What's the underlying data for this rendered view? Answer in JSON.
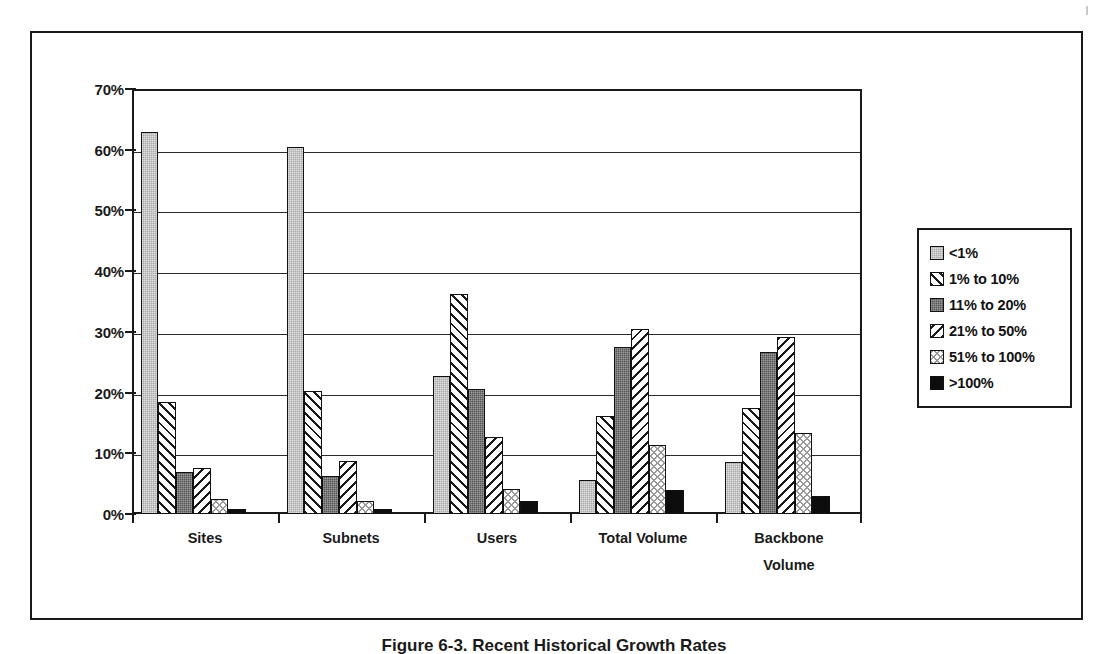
{
  "chart_data": {
    "type": "bar",
    "title": "",
    "subtitle": "",
    "xlabel": "",
    "ylabel": "",
    "ylim": [
      0,
      70
    ],
    "ytick_labels": [
      "70%",
      "60%",
      "50%",
      "40%",
      "30%",
      "20%",
      "10%",
      "0%"
    ],
    "ytick_values": [
      70,
      60,
      50,
      40,
      30,
      20,
      10,
      0
    ],
    "grid": true,
    "grid_axis": "y",
    "legend_position": "right",
    "categories": [
      "Sites",
      "Subnets",
      "Users",
      "Total Volume",
      "Backbone Volume"
    ],
    "category_label_lines": [
      [
        "Sites"
      ],
      [
        "Subnets"
      ],
      [
        "Users"
      ],
      [
        "Total Volume"
      ],
      [
        "Backbone",
        "Volume"
      ]
    ],
    "series": [
      {
        "name": "<1%",
        "pattern": "light-gray-solid",
        "values": [
          63.0,
          60.5,
          22.8,
          5.6,
          8.6
        ]
      },
      {
        "name": "1% to 10%",
        "pattern": "forward-diagonal-hatch",
        "values": [
          18.5,
          20.3,
          36.3,
          16.1,
          17.4
        ]
      },
      {
        "name": "11% to 20%",
        "pattern": "dark-gray-solid",
        "values": [
          7.0,
          6.3,
          20.6,
          27.5,
          26.7
        ]
      },
      {
        "name": "21% to 50%",
        "pattern": "backward-diagonal-hatch",
        "values": [
          7.5,
          8.8,
          12.7,
          30.4,
          29.1
        ]
      },
      {
        "name": "51% to 100%",
        "pattern": "light-cross-hatch",
        "values": [
          2.5,
          2.1,
          4.2,
          11.4,
          13.3
        ]
      },
      {
        "name": ">100%",
        "pattern": "solid-black",
        "values": [
          0.8,
          0.9,
          2.1,
          3.9,
          3.0
        ]
      }
    ]
  },
  "legend": {
    "items": [
      {
        "label": "<1%",
        "swatch": "light-gray-swatch"
      },
      {
        "label": "1% to 10%",
        "swatch": "forward-diagonal-swatch"
      },
      {
        "label": "11% to 20%",
        "swatch": "dark-gray-swatch"
      },
      {
        "label": "21% to 50%",
        "swatch": "backward-diagonal-swatch"
      },
      {
        "label": "51% to 100%",
        "swatch": "cross-hatch-swatch"
      },
      {
        "label": ">100%",
        "swatch": "black-swatch"
      }
    ]
  },
  "caption": {
    "text": "Figure 6-3.  Recent Historical Growth Rates"
  },
  "colors": {
    "axis": "#1a1a1a",
    "grid": "#2b2b2b",
    "light_gray": "#aaaaaa",
    "dark_gray": "#555555",
    "black": "#0d0d0d",
    "background": "#ffffff"
  }
}
